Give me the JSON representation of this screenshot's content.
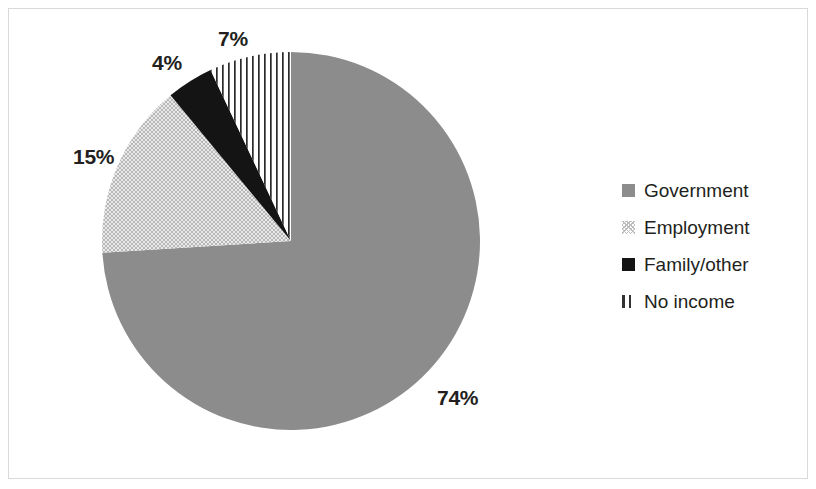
{
  "chart_data": {
    "type": "pie",
    "title": "",
    "subtitle": "",
    "xlabel": "",
    "ylabel": "",
    "legend_position": "right",
    "grid": false,
    "categories": [
      "Government",
      "Employment",
      "Family/other",
      "No income"
    ],
    "values": [
      74,
      15,
      4,
      7
    ],
    "value_unit": "%",
    "data_labels": [
      "74%",
      "15%",
      "4%",
      "7%"
    ],
    "slices": [
      {
        "label": "Government",
        "value": 74,
        "data_label": "74%",
        "fill": "solid-gray",
        "color": "#8c8c8c"
      },
      {
        "label": "Employment",
        "value": 15,
        "data_label": "15%",
        "fill": "crosshatch-light",
        "color": "#bdbdbd"
      },
      {
        "label": "Family/other",
        "value": 4,
        "data_label": "4%",
        "fill": "solid-black",
        "color": "#141414"
      },
      {
        "label": "No income",
        "value": 7,
        "data_label": "7%",
        "fill": "vertical-lines",
        "color": "#333333"
      }
    ]
  },
  "legend": {
    "items": [
      {
        "label": "Government",
        "swatch": "solid-gray-swatch"
      },
      {
        "label": "Employment",
        "swatch": "crosshatch-swatch"
      },
      {
        "label": "Family/other",
        "swatch": "solid-black-swatch"
      },
      {
        "label": "No income",
        "swatch": "vertical-lines-swatch"
      }
    ]
  },
  "labels": {
    "government": "74%",
    "employment": "15%",
    "family_other": "4%",
    "no_income": "7%"
  },
  "colors": {
    "government": "#8c8c8c",
    "employment": "#bdbdbd",
    "family_other": "#141414",
    "no_income": "#333333",
    "text": "#231f20",
    "border": "#d9d9d9",
    "background": "#ffffff"
  }
}
